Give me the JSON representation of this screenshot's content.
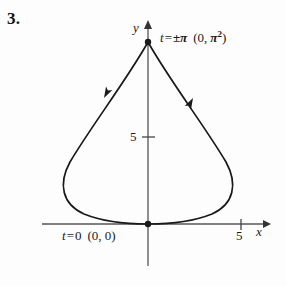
{
  "figure": {
    "problem_number": "3.",
    "background_color": "#fdfdfd",
    "ink_color": "#1a1a1a",
    "axis_color": "#555555"
  },
  "axes": {
    "y_axis_label": "y",
    "x_axis_label": "x",
    "y_tick_label": "5",
    "x_tick_label": "5",
    "origin_px": {
      "x": 148,
      "y": 224
    },
    "x_axis_start_px": 42,
    "x_axis_end_px": 268,
    "y_axis_top_px": 24,
    "y_axis_bottom_px": 266,
    "x_tick_px": 241,
    "y_tick_px": 137
  },
  "annotations": {
    "cusp": {
      "param_var": "t",
      "equals": "=",
      "param_value": "±π",
      "point_open": "(0,",
      "point_pi": "π",
      "point_exponent": "2",
      "point_close": ")",
      "full_text": "t = ±π  (0, π²)",
      "position_px": {
        "x": 160,
        "y": 30
      }
    },
    "origin": {
      "param_var": "t",
      "equals": "=",
      "param_value": "0",
      "point": "(0, 0)",
      "full_text": "t = 0  (0, 0)",
      "position_px": {
        "x": 62,
        "y": 229
      }
    }
  },
  "curve": {
    "name": "closed-teardrop-parametric-curve",
    "stroke_color": "#1a1a1a",
    "stroke_width": 1.7,
    "cusp_point_px": {
      "x": 148,
      "y": 42
    },
    "origin_point_px": {
      "x": 148,
      "y": 224
    },
    "leftmost_px": {
      "x": 63,
      "y": 185
    },
    "rightmost_px": {
      "x": 234,
      "y": 185
    },
    "path_right": "M 148 42 C 168 78, 206 128, 226 162 C 238 184, 234 204, 212 214 C 192 222, 168 224, 148 224",
    "path_left": "M 148 42 C 128 78, 90 128, 70 162 C 58 184, 62 204, 84 214 C 104 222, 128 224, 148 224",
    "direction_markers": [
      {
        "name": "arrow-left-branch",
        "position_px": {
          "x": 104,
          "y": 98
        },
        "direction": "down-left",
        "angle_deg": 118
      },
      {
        "name": "arrow-right-branch",
        "position_px": {
          "x": 193,
          "y": 98
        },
        "direction": "up-left",
        "angle_deg": 298
      }
    ],
    "node_dots": [
      {
        "name": "cusp-dot",
        "x": 148,
        "y": 42,
        "r": 3.2
      },
      {
        "name": "origin-dot",
        "x": 148,
        "y": 224,
        "r": 3.2
      }
    ]
  }
}
